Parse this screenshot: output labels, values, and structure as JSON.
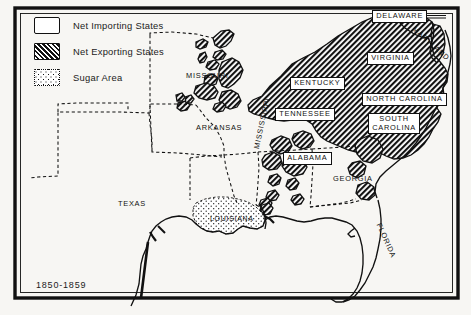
{
  "map": {
    "title_stamp": "1850-1859",
    "legend": {
      "items": [
        {
          "label": "Net Importing States",
          "swatch": "plain-white-box-icon"
        },
        {
          "label": "Net Exporting States",
          "swatch": "diagonal-hatch-box-icon"
        },
        {
          "label": "Sugar Area",
          "swatch": "stipple-dot-box-icon"
        }
      ]
    },
    "labels": [
      {
        "name": "delaware",
        "text": "DELAWARE",
        "style": "boxed",
        "x": 372,
        "y": 10,
        "rotate": 0
      },
      {
        "name": "maryland",
        "text": "MARYLAND",
        "style": "plain",
        "x": 416,
        "y": 25,
        "rotate": 42
      },
      {
        "name": "virginia",
        "text": "VIRGINIA",
        "style": "boxed",
        "x": 367,
        "y": 52,
        "rotate": 0
      },
      {
        "name": "kentucky",
        "text": "KENTUCKY",
        "style": "boxed",
        "x": 290,
        "y": 77,
        "rotate": 0
      },
      {
        "name": "north-carolina",
        "text": "NORTH CAROLINA",
        "style": "boxed",
        "x": 362,
        "y": 93,
        "rotate": 0
      },
      {
        "name": "tennessee",
        "text": "TENNESSEE",
        "style": "boxed",
        "x": 275,
        "y": 108,
        "rotate": 0
      },
      {
        "name": "south-carolina",
        "text": "SOUTH\nCAROLINA",
        "style": "boxed",
        "x": 368,
        "y": 113,
        "rotate": 0
      },
      {
        "name": "missouri",
        "text": "MISSOURI",
        "style": "plain",
        "x": 186,
        "y": 72,
        "rotate": 0
      },
      {
        "name": "arkansas",
        "text": "ARKANSAS",
        "style": "plain",
        "x": 196,
        "y": 124,
        "rotate": 0
      },
      {
        "name": "alabama",
        "text": "ALABAMA",
        "style": "boxed",
        "x": 283,
        "y": 152,
        "rotate": 0
      },
      {
        "name": "georgia",
        "text": "GEORGIA",
        "style": "plain",
        "x": 333,
        "y": 175,
        "rotate": 0
      },
      {
        "name": "mississippi",
        "text": "MISSISSIPPI",
        "style": "plain",
        "x": 253,
        "y": 148,
        "rotate": -78
      },
      {
        "name": "texas",
        "text": "TEXAS",
        "style": "plain",
        "x": 118,
        "y": 200,
        "rotate": 0
      },
      {
        "name": "louisiana",
        "text": "LOUISIANA",
        "style": "sugar",
        "x": 210,
        "y": 215,
        "rotate": 0
      },
      {
        "name": "florida",
        "text": "FLORIDA",
        "style": "plain",
        "x": 382,
        "y": 222,
        "rotate": 66
      }
    ],
    "exporting_states": [
      "Delaware",
      "Maryland",
      "Virginia",
      "Kentucky",
      "North Carolina",
      "Tennessee",
      "South Carolina"
    ],
    "importing_states": [
      "Missouri",
      "Arkansas",
      "Alabama",
      "Georgia",
      "Mississippi",
      "Texas",
      "Louisiana",
      "Florida"
    ],
    "sugar_states": [
      "Louisiana"
    ],
    "colors": {
      "ink": "#111111",
      "paper": "#f7f6f3",
      "hatch_fill": "#111111",
      "label_box": "#ffffff"
    }
  }
}
